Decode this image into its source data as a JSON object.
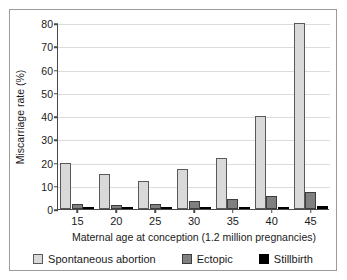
{
  "chart_data": {
    "type": "bar",
    "title": "",
    "subtitle": "",
    "xlabel": "Maternal age at conception (1.2 million pregnancies)",
    "ylabel": "Miscarriage rate (%)",
    "categories": [
      "15",
      "20",
      "25",
      "30",
      "35",
      "40",
      "45"
    ],
    "series": [
      {
        "name": "Spontaneous abortion",
        "color": "#d9d9d9",
        "values": [
          20,
          15,
          12,
          17,
          22,
          40,
          80
        ]
      },
      {
        "name": "Ectopic",
        "color": "#808080",
        "values": [
          2.2,
          1.9,
          2.3,
          3.3,
          4.4,
          5.6,
          7.4
        ]
      },
      {
        "name": "Stillbirth",
        "color": "#000000",
        "values": [
          0.8,
          0.7,
          0.7,
          0.8,
          0.9,
          1.0,
          1.5
        ]
      }
    ],
    "ylim": [
      0,
      80
    ],
    "yticks": [
      0,
      10,
      20,
      30,
      40,
      50,
      60,
      70,
      80
    ],
    "ytick_labels": [
      "0",
      "10",
      "20",
      "30",
      "40",
      "50",
      "60",
      "70",
      "80"
    ],
    "grid": true,
    "grid_axis": "y",
    "legend_position": "bottom-center",
    "legend_entries": [
      "Spontaneous abortion",
      "Ectopic",
      "Stillbirth"
    ]
  },
  "style": {
    "frame_border_color": "#9b9b9b",
    "axis_color": "#4a4a4a",
    "gridline_color": "#dcdcdc",
    "text_color": "#1a1a1a",
    "background": "#ffffff"
  }
}
